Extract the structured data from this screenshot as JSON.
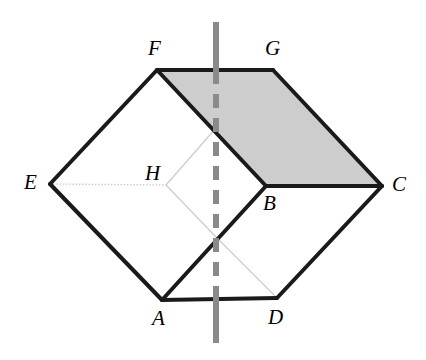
{
  "figure": {
    "canvas": {
      "width": 426,
      "height": 360
    },
    "background_color": "#ffffff",
    "stroke_color": "#1a1a1a",
    "faint_stroke_color": "#cfcfcf",
    "shade_fill_color": "#cdcdcd",
    "cut_line_color": "#888888",
    "points": {
      "A": {
        "x": 162,
        "y": 300,
        "label": "A",
        "label_x": 152,
        "label_y": 308
      },
      "B": {
        "x": 266,
        "y": 186,
        "label": "B",
        "label_x": 263,
        "label_y": 193
      },
      "C": {
        "x": 382,
        "y": 186,
        "label": "C",
        "label_x": 392,
        "label_y": 174
      },
      "D": {
        "x": 277,
        "y": 298,
        "label": "D",
        "label_x": 268,
        "label_y": 307
      },
      "E": {
        "x": 50,
        "y": 184,
        "label": "E",
        "label_x": 24,
        "label_y": 172
      },
      "F": {
        "x": 157,
        "y": 70,
        "label": "F",
        "label_x": 148,
        "label_y": 38
      },
      "G": {
        "x": 273,
        "y": 70,
        "label": "G",
        "label_x": 265,
        "label_y": 38
      },
      "H": {
        "x": 166,
        "y": 185,
        "label": "H",
        "label_x": 145,
        "label_y": 163
      },
      "P_top": {
        "x": 216,
        "y": 128
      },
      "P_bottom": {
        "x": 216,
        "y": 237
      }
    },
    "solid_edges": [
      {
        "name": "edge-F-G",
        "from": "F",
        "to": "G"
      },
      {
        "name": "edge-G-C",
        "from": "G",
        "to": "C"
      },
      {
        "name": "edge-C-B",
        "from": "C",
        "to": "B"
      },
      {
        "name": "edge-B-F",
        "from": "B",
        "to": "F"
      },
      {
        "name": "edge-F-E",
        "from": "F",
        "to": "E"
      },
      {
        "name": "edge-E-A",
        "from": "E",
        "to": "A"
      },
      {
        "name": "edge-A-D",
        "from": "A",
        "to": "D"
      },
      {
        "name": "edge-D-C",
        "from": "D",
        "to": "C"
      },
      {
        "name": "edge-A-B",
        "from": "A",
        "to": "B"
      }
    ],
    "faint_edges": [
      {
        "name": "hidden-edge-E-H",
        "from": "E",
        "to": "H",
        "style": "dotted"
      },
      {
        "name": "hidden-edge-H-Ptop",
        "from": "H",
        "to": "P_top",
        "style": "solid"
      },
      {
        "name": "hidden-edge-H-Pbottom",
        "from": "H",
        "to": "P_bottom",
        "style": "solid"
      },
      {
        "name": "hidden-edge-Ptop-G",
        "from": "P_top",
        "to": "G",
        "style": "solid"
      },
      {
        "name": "hidden-edge-Pbottom-D",
        "from": "P_bottom",
        "to": "D",
        "style": "solid"
      }
    ],
    "shaded_region": {
      "name": "shaded-quadrilateral-FGCB",
      "vertices": [
        "F",
        "G",
        "C",
        "B"
      ]
    },
    "cut_line": {
      "name": "vertical-cut-line",
      "x": 216,
      "y_start": 22,
      "y_end": 343,
      "solid_segments": [
        [
          22,
          70
        ],
        [
          300,
          343
        ]
      ],
      "dashed_segment": [
        70,
        300
      ],
      "width": 6,
      "dash_pattern": "14 10"
    }
  }
}
